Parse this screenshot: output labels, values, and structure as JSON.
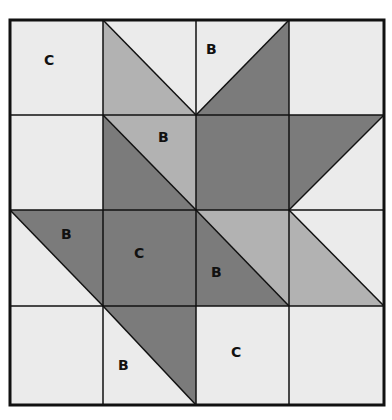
{
  "diagram": {
    "type": "quilt-block",
    "grid": {
      "rows": 4,
      "cols": 4
    },
    "colors": {
      "light": "#ebebeb",
      "medium": "#b2b2b2",
      "dark": "#7b7b7b",
      "line": "#111111"
    },
    "labels": [
      {
        "text": "C",
        "row": 0,
        "col": 0
      },
      {
        "text": "B",
        "row": 0,
        "col": 2
      },
      {
        "text": "B",
        "row": 1,
        "col": 1
      },
      {
        "text": "B",
        "row": 2,
        "col": 0
      },
      {
        "text": "C",
        "row": 2,
        "col": 1
      },
      {
        "text": "B",
        "row": 2,
        "col": 2
      },
      {
        "text": "B",
        "row": 3,
        "col": 1
      },
      {
        "text": "C",
        "row": 3,
        "col": 2
      }
    ]
  }
}
